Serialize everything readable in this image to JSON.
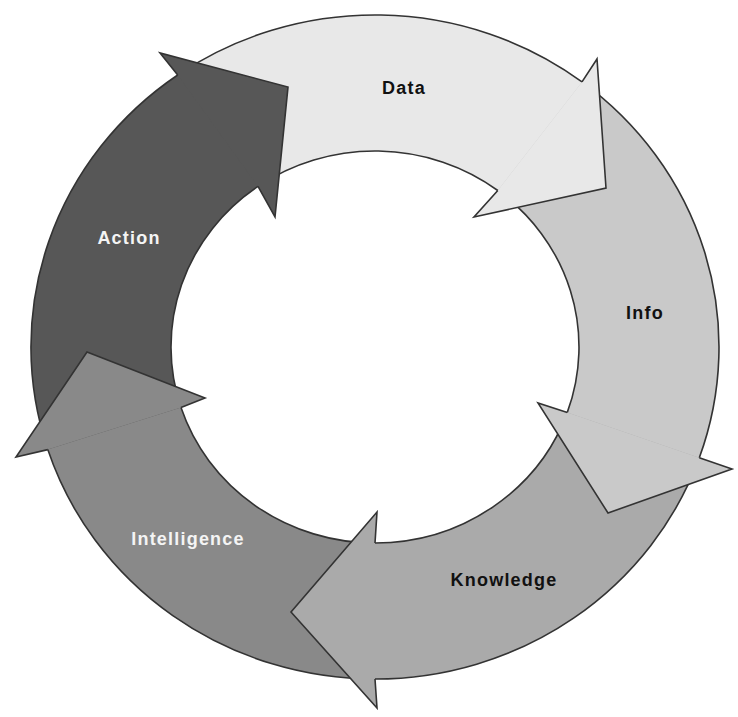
{
  "diagram": {
    "type": "cycle",
    "stroke_color": "#333333",
    "background": "#ffffff",
    "stages": [
      {
        "label": "Data",
        "fill": "#e8e8e8",
        "text_color": "#111111"
      },
      {
        "label": "Info",
        "fill": "#c9c9c9",
        "text_color": "#111111"
      },
      {
        "label": "Knowledge",
        "fill": "#aaaaaa",
        "text_color": "#111111"
      },
      {
        "label": "Intelligence",
        "fill": "#898989",
        "text_color": "#f4f4f4"
      },
      {
        "label": "Action",
        "fill": "#575757",
        "text_color": "#f4f4f4"
      }
    ],
    "flow": [
      "Data",
      "Info",
      "Knowledge",
      "Intelligence",
      "Action",
      "Data"
    ]
  }
}
